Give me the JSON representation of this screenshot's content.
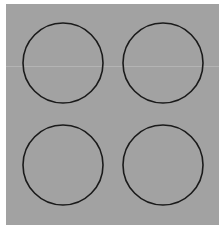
{
  "image": {
    "description": "Four black outlined circles arranged in a 2x2 grid on a gray background",
    "background_color": "#a2a2a2",
    "stroke_color": "#1a1a1a",
    "shapes": [
      {
        "name": "circle-top-left",
        "type": "circle"
      },
      {
        "name": "circle-top-right",
        "type": "circle"
      },
      {
        "name": "circle-bottom-left",
        "type": "circle"
      },
      {
        "name": "circle-bottom-right",
        "type": "circle"
      }
    ]
  }
}
